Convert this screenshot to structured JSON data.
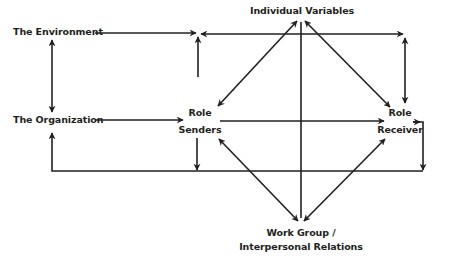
{
  "diagram": {
    "nodes": {
      "environment": "The Environment",
      "organization": "The Organization",
      "individual_variables": "Individual Variables",
      "role_senders_line1": "Role",
      "role_senders_line2": "Senders",
      "role_receiver_line1": "Role",
      "role_receiver_line2": "Receiver",
      "work_group_line1": "Work Group /",
      "work_group_line2": "Interpersonal Relations"
    },
    "edges": [
      {
        "from": "The Environment",
        "to": "Role Senders/Receiver top junction",
        "type": "arrow"
      },
      {
        "from": "The Environment",
        "to": "The Organization",
        "type": "double-arrow"
      },
      {
        "from": "The Organization",
        "to": "Role Senders",
        "type": "arrow"
      },
      {
        "from": "Role Senders",
        "to": "Role Receiver",
        "type": "arrow"
      },
      {
        "from": "Role Receiver",
        "to": "The Organization",
        "type": "feedback-loop"
      },
      {
        "from": "Role Senders",
        "to": "bottom feedback line",
        "type": "arrow"
      },
      {
        "from": "Individual Variables",
        "to": "Role Senders",
        "type": "double-arrow"
      },
      {
        "from": "Individual Variables",
        "to": "Role Receiver",
        "type": "double-arrow"
      },
      {
        "from": "Individual Variables",
        "to": "Work Group / Interpersonal Relations",
        "type": "line"
      },
      {
        "from": "Work Group / Interpersonal Relations",
        "to": "Role Senders",
        "type": "double-arrow"
      },
      {
        "from": "Work Group / Interpersonal Relations",
        "to": "Role Receiver",
        "type": "double-arrow"
      },
      {
        "from": "top junction",
        "to": "Role Receiver",
        "type": "double-arrow"
      }
    ],
    "colors": {
      "line": "#231f20",
      "text": "#231f20",
      "background": "#ffffff"
    }
  }
}
